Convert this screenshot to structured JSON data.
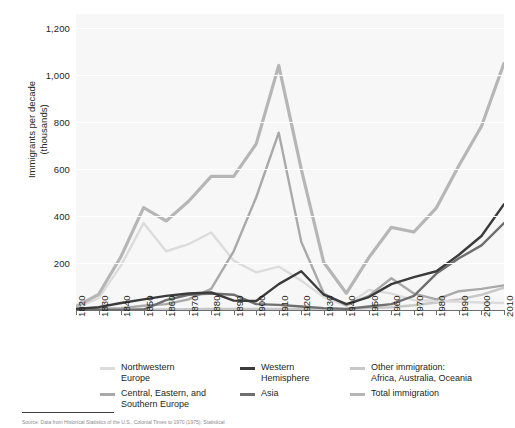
{
  "chart_data": {
    "type": "line",
    "title": "",
    "xlabel": "",
    "ylabel": "Immigrants per decade\n(thousands)",
    "xlim": [
      1820,
      2010
    ],
    "ylim": [
      0,
      1260
    ],
    "grid": true,
    "legend_position": "bottom",
    "x": [
      1820,
      1830,
      1840,
      1850,
      1860,
      1870,
      1880,
      1890,
      1900,
      1910,
      1920,
      1930,
      1940,
      1950,
      1960,
      1970,
      1980,
      1990,
      2000,
      2010
    ],
    "y_ticks": [
      200,
      400,
      600,
      800,
      1000,
      1200
    ],
    "y_tick_labels": [
      "200",
      "400",
      "600",
      "800",
      "1,000",
      "1,200"
    ],
    "x_tick_labels": [
      "1820",
      "1830",
      "1840",
      "1850",
      "1860",
      "1870",
      "1880",
      "1890",
      "1900",
      "1910",
      "1920",
      "1930",
      "1940",
      "1950",
      "1960",
      "1970",
      "1980",
      "1990",
      "2000",
      "2010"
    ],
    "series": [
      {
        "name": "Northwestern Europe",
        "color": "#dcdcdc",
        "values": [
          8,
          50,
          190,
          370,
          250,
          280,
          330,
          210,
          160,
          185,
          125,
          55,
          18,
          85,
          70,
          42,
          38,
          35,
          32,
          30
        ]
      },
      {
        "name": "Central, Eastern, and Southern Europe",
        "color": "#a9a9a9",
        "values": [
          2,
          4,
          8,
          18,
          25,
          45,
          90,
          250,
          480,
          755,
          290,
          70,
          20,
          60,
          135,
          70,
          45,
          80,
          90,
          105
        ]
      },
      {
        "name": "Western Hemisphere",
        "color": "#3b3b3b",
        "values": [
          5,
          12,
          30,
          45,
          60,
          70,
          75,
          40,
          38,
          110,
          165,
          65,
          25,
          55,
          110,
          140,
          165,
          235,
          315,
          450
        ]
      },
      {
        "name": "Asia",
        "color": "#6f6f6f",
        "values": [
          0,
          0,
          0,
          2,
          42,
          65,
          70,
          65,
          25,
          22,
          15,
          8,
          5,
          15,
          25,
          60,
          155,
          220,
          275,
          370
        ]
      },
      {
        "name": "Other immigration: Africa, Australia, Oceania",
        "color": "#c8c8c8",
        "values": [
          0,
          0,
          0,
          1,
          2,
          3,
          4,
          4,
          4,
          5,
          5,
          4,
          3,
          8,
          12,
          20,
          32,
          45,
          65,
          95
        ]
      },
      {
        "name": "Total immigration",
        "color": "#b6b6b6",
        "values": [
          15,
          66,
          228,
          436,
          379,
          463,
          569,
          569,
          707,
          1041,
          600,
          202,
          71,
          223,
          352,
          332,
          435,
          615,
          782,
          1050
        ]
      }
    ],
    "legend": [
      {
        "label": "Northwestern\nEurope",
        "color": "#dcdcdc"
      },
      {
        "label": "Central, Eastern, and\nSouthern Europe",
        "color": "#a9a9a9"
      },
      {
        "label": "Western\nHemisphere",
        "color": "#3b3b3b"
      },
      {
        "label": "Asia",
        "color": "#6f6f6f"
      },
      {
        "label": "Other immigration:\nAfrica, Australia, Oceania",
        "color": "#c8c8c8"
      },
      {
        "label": "Total immigration",
        "color": "#b6b6b6"
      }
    ]
  },
  "source": {
    "note": "Source: Data from Historical Statistics of the U.S., Colonial Times to 1970 (1975); Statistical"
  }
}
